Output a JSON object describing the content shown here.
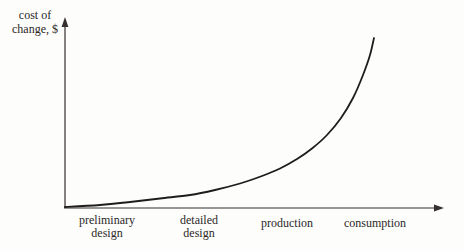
{
  "figure": {
    "ylabel_line1": "cost of",
    "ylabel_line2": "change, $"
  },
  "chart_data": {
    "type": "line",
    "title": "",
    "xlabel": "",
    "ylabel": "cost of change, $",
    "xlabel_phases": [
      "preliminary design",
      "detailed design",
      "production",
      "consumption"
    ],
    "axes": {
      "x_arrow": true,
      "y_arrow": true,
      "ticks": "none",
      "grid": false
    },
    "legend": "none",
    "series": [
      {
        "name": "cost of change",
        "x_norm": [
          0,
          0.113,
          0.21,
          0.307,
          0.405,
          0.485,
          0.566,
          0.638,
          0.696,
          0.751,
          0.799,
          0.848,
          0.893,
          0.932,
          0.964,
          0.987,
          1.0
        ],
        "y_norm": [
          0,
          0.012,
          0.03,
          0.05,
          0.071,
          0.101,
          0.139,
          0.183,
          0.228,
          0.284,
          0.346,
          0.426,
          0.527,
          0.645,
          0.781,
          0.899,
          1.0
        ]
      }
    ],
    "curve_px": [
      [
        65,
        207
      ],
      [
        100,
        205
      ],
      [
        130,
        202
      ],
      [
        160,
        198.5
      ],
      [
        190,
        195
      ],
      [
        215,
        190
      ],
      [
        240,
        183.5
      ],
      [
        262,
        176
      ],
      [
        280,
        168.5
      ],
      [
        297,
        159
      ],
      [
        312,
        148.5
      ],
      [
        327,
        135
      ],
      [
        341,
        118
      ],
      [
        353,
        98
      ],
      [
        363,
        75
      ],
      [
        370,
        55
      ],
      [
        374,
        38
      ]
    ],
    "colors": {
      "curve": "#1f1d1b",
      "axis": "#34302d",
      "text": "#2b2826",
      "background": "#fdfdfc"
    }
  }
}
